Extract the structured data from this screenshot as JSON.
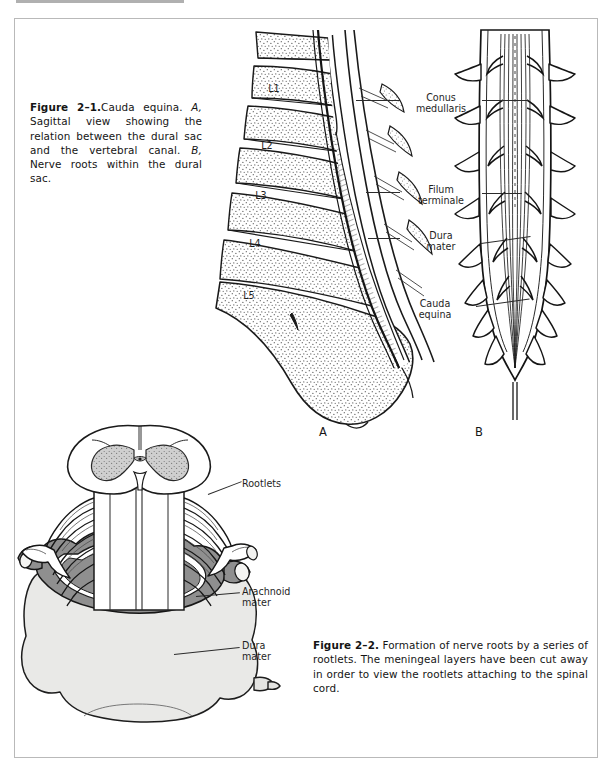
{
  "page": {
    "figures": [
      "figure-2-1",
      "figure-2-2"
    ]
  },
  "figure_2_1": {
    "caption": {
      "number": "Figure 2–1.",
      "text_1": "Cauda equina. ",
      "italic_a": "A,",
      "text_2": " Sagittal view showing the relation between the dural sac and the vertebral canal. ",
      "italic_b": "B,",
      "text_3": " Nerve roots within the dural sac."
    },
    "panel_a": {
      "letter": "A",
      "vertebra_labels": [
        "L1",
        "L2",
        "L3",
        "L4",
        "L5"
      ]
    },
    "panel_b": {
      "letter": "B"
    },
    "labels": [
      {
        "name": "conus-medullaris",
        "text": "Conus\nmedullaris"
      },
      {
        "name": "filum-terminale",
        "text": "Filum\nterminale"
      },
      {
        "name": "dura-mater",
        "text": "Dura\nmater"
      },
      {
        "name": "cauda-equina",
        "text": "Cauda\nequina"
      }
    ]
  },
  "figure_2_2": {
    "caption": {
      "number": "Figure 2–2.",
      "text": " Formation of nerve roots by a series of rootlets. The meningeal layers have been cut away in order to view the rootlets attaching to the spinal cord."
    },
    "labels": [
      {
        "name": "rootlets",
        "text": "Rootlets"
      },
      {
        "name": "arachnoid-mater",
        "text": "Arachnoid\nmater"
      },
      {
        "name": "dura-mater",
        "text": "Dura\nmater"
      }
    ]
  },
  "colors": {
    "ink": "#1a1a1a",
    "frame": "#b9b9b9",
    "page": "#ffffff",
    "gray_matter": "#c9c9c9",
    "arachnoid": "#8d8d8d",
    "dura": "#e8e8e6",
    "stipple": "#555555"
  }
}
